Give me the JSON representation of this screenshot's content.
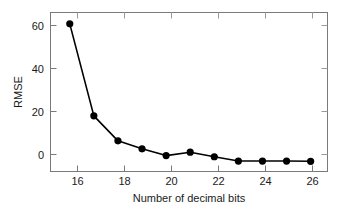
{
  "chart_data": {
    "type": "line",
    "title": "",
    "xlabel": "Number of decimal bits",
    "ylabel": "RMSE",
    "x": [
      16,
      17,
      18,
      19,
      20,
      21,
      22,
      23,
      24,
      25,
      26
    ],
    "values": [
      61,
      20.5,
      9.5,
      6,
      3,
      4.5,
      2.5,
      0.6,
      0.6,
      0.6,
      0.5
    ],
    "series": [
      {
        "name": "RMSE",
        "values": [
          61,
          20.5,
          9.5,
          6,
          3,
          4.5,
          2.5,
          0.6,
          0.6,
          0.6,
          0.5
        ]
      }
    ],
    "xlim": [
      15.2,
      26.7
    ],
    "ylim": [
      -4,
      66
    ],
    "xticks": [
      16,
      18,
      20,
      22,
      24,
      26
    ],
    "xticklabels": [
      "16",
      "18",
      "20",
      "22",
      "24",
      "26"
    ],
    "yticks": [
      0,
      20,
      40,
      60
    ],
    "yticklabels": [
      "0",
      "20",
      "40",
      "60"
    ],
    "grid": false,
    "legend": false,
    "legend_position": "none",
    "marker": "filled-circle",
    "line_color": "#000000",
    "marker_color": "#000000",
    "axis_color": "#6b6b6b",
    "text_color": "#1a1a1a",
    "background_color": "#ffffff"
  }
}
